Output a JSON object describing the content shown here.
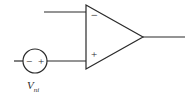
{
  "diagram": {
    "type": "op-amp circuit",
    "opamp": {
      "inverting_symbol": "−",
      "noninverting_symbol": "+"
    },
    "source": {
      "neg_symbol": "−",
      "pos_symbol": "+",
      "label_main": "V",
      "label_sub": "ni"
    },
    "colors": {
      "stroke": "#2a2a2a",
      "background": "#ffffff"
    }
  }
}
